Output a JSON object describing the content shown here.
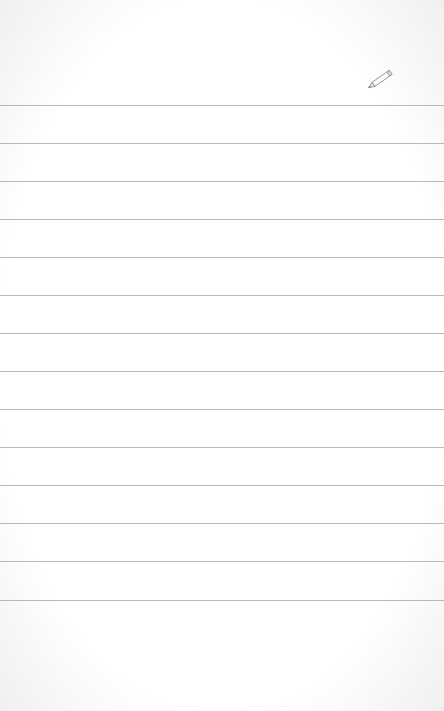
{
  "notepad": {
    "background_color": "#ffffff",
    "line_color": "#b8b8b8",
    "line_count": 14,
    "line_positions": [
      105,
      143,
      181,
      219,
      257,
      295,
      333,
      371,
      409,
      447,
      485,
      523,
      561,
      600
    ],
    "lines_text": [
      "",
      "",
      "",
      "",
      "",
      "",
      "",
      "",
      "",
      "",
      "",
      "",
      "",
      ""
    ]
  },
  "toolbar": {
    "edit_icon": "pencil-icon"
  }
}
